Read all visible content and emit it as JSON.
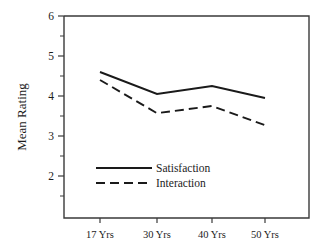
{
  "chart_data": {
    "type": "line",
    "title": "",
    "subtitle": "",
    "xlabel": "",
    "ylabel": "Mean Rating",
    "categories": [
      "17 Yrs",
      "30 Yrs",
      "40 Yrs",
      "50 Yrs"
    ],
    "series": [
      {
        "name": "Satisfaction",
        "style": "solid",
        "values": [
          4.6,
          4.05,
          4.25,
          3.95
        ]
      },
      {
        "name": "Interaction",
        "style": "dashed",
        "values": [
          4.4,
          3.57,
          3.75,
          3.27
        ]
      }
    ],
    "ylim": [
      1.35,
      6
    ],
    "ytick_labels": [
      "6",
      "5",
      "4",
      "3",
      "2"
    ],
    "ytick_values": [
      6,
      5,
      4,
      3,
      2
    ],
    "yminor_values": [
      5.5,
      4.5,
      3.5,
      2.5,
      1.5
    ],
    "grid": false,
    "legend_position": "inside-center-left",
    "line_color": "#1a1a1a",
    "frame_color": "#3a3a3a",
    "background": "#ffffff"
  },
  "axis": {
    "y_label": "Mean Rating",
    "y_ticks": [
      {
        "label": "6"
      },
      {
        "label": "5"
      },
      {
        "label": "4"
      },
      {
        "label": "3"
      },
      {
        "label": "2"
      }
    ],
    "x_ticks": [
      {
        "label": "17 Yrs"
      },
      {
        "label": "30 Yrs"
      },
      {
        "label": "40 Yrs"
      },
      {
        "label": "50 Yrs"
      }
    ]
  },
  "legend": {
    "entries": [
      {
        "label": "Satisfaction",
        "style": "solid"
      },
      {
        "label": "Interaction",
        "style": "dashed"
      }
    ]
  }
}
